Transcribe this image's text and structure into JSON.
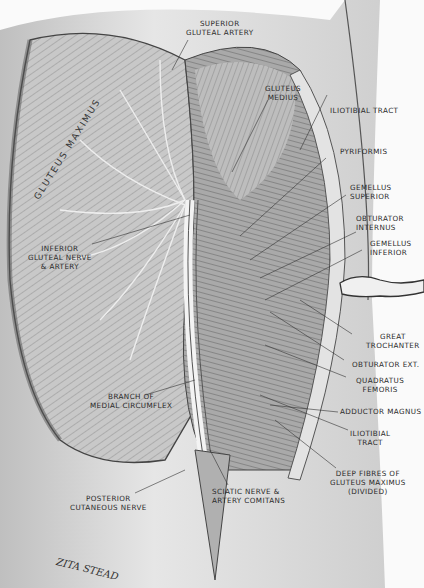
{
  "figure": {
    "muscle_label": "GLUTEUS MAXIMUS",
    "artist_signature": "ZITA STEAD"
  },
  "labels": {
    "superior_gluteal_artery": "SUPERIOR\nGLUTEAL ARTERY",
    "gluteus_medius": "GLUTEUS\nMEDIUS",
    "iliotibial_tract_upper": "ILIOTIBIAL TRACT",
    "pyriformis": "PYRIFORMIS",
    "gemellus_superior": "GEMELLUS\nSUPERIOR",
    "obturator_internus": "OBTURATOR\nINTERNUS",
    "gemellus_inferior": "GEMELLUS\nINFERIOR",
    "inferior_gluteal": "INFERIOR\nGLUTEAL NERVE\n& ARTERY",
    "great_trochanter": "GREAT\nTROCHANTER",
    "obturator_ext": "OBTURATOR EXT.",
    "quadratus_femoris": "QUADRATUS\nFEMORIS",
    "branch_medial_circumflex": "BRANCH OF\nMEDIAL CIRCUMFLEX",
    "adductor_magnus": "ADDUCTOR MAGNUS",
    "iliotibial_tract_lower": "ILIOTIBIAL\nTRACT",
    "deep_fibres": "DEEP FIBRES OF\nGLUTEUS MAXIMUS\n(DIVIDED)",
    "posterior_cutaneous": "POSTERIOR\nCUTANEOUS NERVE",
    "sciatic_nerve": "SCIATIC NERVE &\nARTERY COMITANS"
  },
  "colors": {
    "background": "#fafafa",
    "skin": "#d9d9d9",
    "muscle_light": "#cfcfcf",
    "muscle_dark": "#7a7a7a",
    "ink": "#2a2a2a"
  }
}
